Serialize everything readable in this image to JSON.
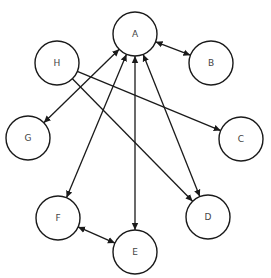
{
  "diagram": {
    "type": "directed-graph",
    "node_radius": 22,
    "nodes": [
      {
        "id": "A",
        "label": "A",
        "x": 135,
        "y": 34
      },
      {
        "id": "B",
        "label": "B",
        "x": 211,
        "y": 63
      },
      {
        "id": "H",
        "label": "H",
        "x": 57,
        "y": 63
      },
      {
        "id": "G",
        "label": "G",
        "x": 28,
        "y": 138
      },
      {
        "id": "C",
        "label": "C",
        "x": 241,
        "y": 139
      },
      {
        "id": "F",
        "label": "F",
        "x": 58,
        "y": 218
      },
      {
        "id": "D",
        "label": "D",
        "x": 208,
        "y": 217
      },
      {
        "id": "E",
        "label": "E",
        "x": 135,
        "y": 252
      }
    ],
    "edges": [
      {
        "from": "A",
        "to": "B",
        "direction": "both"
      },
      {
        "from": "A",
        "to": "G",
        "direction": "both"
      },
      {
        "from": "A",
        "to": "F",
        "direction": "both"
      },
      {
        "from": "A",
        "to": "E",
        "direction": "both"
      },
      {
        "from": "A",
        "to": "D",
        "direction": "both"
      },
      {
        "from": "H",
        "to": "C",
        "direction": "forward"
      },
      {
        "from": "H",
        "to": "D",
        "direction": "forward"
      },
      {
        "from": "F",
        "to": "E",
        "direction": "both"
      }
    ]
  }
}
